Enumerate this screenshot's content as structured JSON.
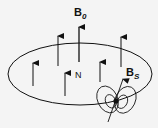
{
  "diagram": {
    "labels": {
      "field_main": "B",
      "field_main_sub": "0",
      "field_source": "B",
      "field_source_sub": "S",
      "north": "N"
    },
    "colors": {
      "ink": "#111111",
      "background": "#f4f4f4"
    }
  }
}
